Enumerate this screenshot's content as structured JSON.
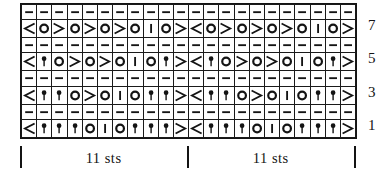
{
  "chart": {
    "columns": 22,
    "rows_total": 8,
    "repeat_stitches": 11,
    "repeat_count": 2,
    "row_numbers": [
      "7",
      "5",
      "3",
      "1"
    ],
    "repeat_label": "11 sts",
    "legend_symbols": {
      "dash": "purl",
      "o": "yarn-over",
      "bar": "knit-one",
      "left-dec": "ssk-left-leaning-decrease",
      "right-dec": "k2tog-right-leaning-decrease",
      "bobble": "bobble-or-knot"
    },
    "colors": {
      "ink": "#141414",
      "paper": "#ffffff"
    },
    "rows": [
      {
        "label": "",
        "kind": "purl",
        "cells": [
          "dash",
          "dash",
          "dash",
          "dash",
          "dash",
          "dash",
          "dash",
          "dash",
          "dash",
          "dash",
          "dash",
          "dash",
          "dash",
          "dash",
          "dash",
          "dash",
          "dash",
          "dash",
          "dash",
          "dash",
          "dash",
          "dash"
        ]
      },
      {
        "label": "7",
        "kind": "pattern",
        "cells": [
          "left-dec",
          "o",
          "right-dec",
          "o",
          "right-dec",
          "o",
          "right-dec",
          "o",
          "bar",
          "o",
          "right-dec",
          "left-dec",
          "o",
          "right-dec",
          "o",
          "right-dec",
          "o",
          "right-dec",
          "o",
          "bar",
          "o",
          "right-dec"
        ]
      },
      {
        "label": "",
        "kind": "purl",
        "cells": [
          "dash",
          "dash",
          "dash",
          "dash",
          "dash",
          "dash",
          "dash",
          "dash",
          "dash",
          "dash",
          "dash",
          "dash",
          "dash",
          "dash",
          "dash",
          "dash",
          "dash",
          "dash",
          "dash",
          "dash",
          "dash",
          "dash"
        ]
      },
      {
        "label": "5",
        "kind": "pattern",
        "cells": [
          "left-dec",
          "bobble",
          "o",
          "right-dec",
          "o",
          "right-dec",
          "o",
          "bar",
          "o",
          "bobble",
          "right-dec",
          "left-dec",
          "bobble",
          "o",
          "right-dec",
          "o",
          "right-dec",
          "o",
          "bar",
          "o",
          "bobble",
          "right-dec"
        ]
      },
      {
        "label": "",
        "kind": "purl",
        "cells": [
          "dash",
          "dash",
          "dash",
          "dash",
          "dash",
          "dash",
          "dash",
          "dash",
          "dash",
          "dash",
          "dash",
          "dash",
          "dash",
          "dash",
          "dash",
          "dash",
          "dash",
          "dash",
          "dash",
          "dash",
          "dash",
          "dash"
        ]
      },
      {
        "label": "3",
        "kind": "pattern",
        "cells": [
          "left-dec",
          "bobble",
          "bobble",
          "o",
          "right-dec",
          "o",
          "bar",
          "o",
          "bobble",
          "bobble",
          "right-dec",
          "left-dec",
          "bobble",
          "bobble",
          "o",
          "right-dec",
          "o",
          "bar",
          "o",
          "bobble",
          "bobble",
          "right-dec"
        ]
      },
      {
        "label": "",
        "kind": "purl",
        "cells": [
          "dash",
          "dash",
          "dash",
          "dash",
          "dash",
          "dash",
          "dash",
          "dash",
          "dash",
          "dash",
          "dash",
          "dash",
          "dash",
          "dash",
          "dash",
          "dash",
          "dash",
          "dash",
          "dash",
          "dash",
          "dash",
          "dash"
        ]
      },
      {
        "label": "1",
        "kind": "pattern",
        "cells": [
          "left-dec",
          "bobble",
          "bobble",
          "bobble",
          "o",
          "bar",
          "o",
          "bobble",
          "bobble",
          "bobble",
          "right-dec",
          "left-dec",
          "bobble",
          "bobble",
          "bobble",
          "o",
          "bar",
          "o",
          "bobble",
          "bobble",
          "bobble",
          "right-dec"
        ]
      }
    ],
    "repeat_markers": [
      {
        "label": "11 sts"
      },
      {
        "label": "11 sts"
      }
    ]
  }
}
